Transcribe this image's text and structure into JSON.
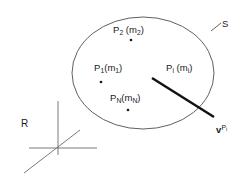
{
  "figure": {
    "background_color": "#ffffff",
    "line_color": "#4d4d4d",
    "bold_line_color": "#111111",
    "text_color": "#1a1a1a"
  },
  "labels": {
    "surface": "S",
    "frame": "R",
    "particle_2": {
      "name": "P",
      "index": "2",
      "mass_open": " (m",
      "mass_index": "2",
      "mass_close": ")"
    },
    "particle_1": {
      "name": "P",
      "index": "1",
      "mass_open": "(m",
      "mass_index": "1",
      "mass_close": ")"
    },
    "particle_i": {
      "name": "P",
      "index": "i",
      "mass_open": " (m",
      "mass_index": "i",
      "mass_close": ")"
    },
    "particle_N": {
      "name": "P",
      "index": "N",
      "mass_open": "(m",
      "mass_index": "N",
      "mass_close": ")"
    },
    "velocity": {
      "name": "v",
      "sup_name": "P",
      "sup_index": "i"
    }
  },
  "geometry": {
    "ellipse": {
      "cx": 143,
      "cy": 73,
      "rx": 71,
      "ry": 56
    },
    "leader_line": {
      "x1": 212,
      "y1": 30,
      "x2": 221,
      "y2": 23
    },
    "bold_segment": {
      "x1": 152,
      "y1": 78,
      "x2": 214,
      "y2": 117
    },
    "points": [
      {
        "id": "P2",
        "x": 131,
        "y": 40
      },
      {
        "id": "P1",
        "x": 101,
        "y": 82
      },
      {
        "id": "PN",
        "x": 128,
        "y": 110
      }
    ],
    "axes": {
      "origin": {
        "x": 58,
        "y": 148
      },
      "vertical": {
        "x1": 58,
        "y1": 101,
        "x2": 58,
        "y2": 154
      },
      "horizontal": {
        "x1": 30,
        "y1": 148,
        "x2": 97,
        "y2": 148
      },
      "diagonal": {
        "x1": 25,
        "y1": 172,
        "x2": 79,
        "y2": 131
      }
    }
  }
}
